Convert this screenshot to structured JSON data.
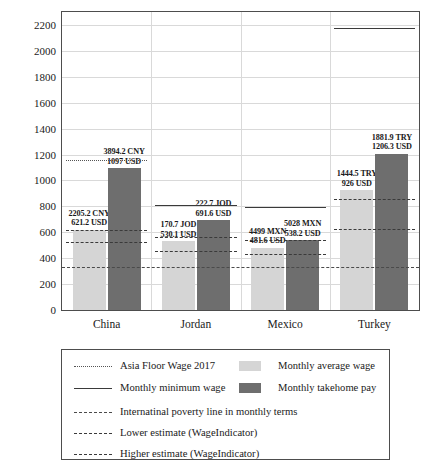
{
  "chart_data": {
    "type": "bar",
    "title": "",
    "xlabel": "",
    "ylabel": "PPP adjusted USD",
    "ylim": [
      0,
      2300
    ],
    "yticks": [
      0,
      200,
      400,
      600,
      800,
      1000,
      1200,
      1400,
      1600,
      1800,
      2000,
      2200
    ],
    "grid": true,
    "legend_position": "below-plot",
    "categories": [
      "China",
      "Jordan",
      "Mexico",
      "Turkey"
    ],
    "series": [
      {
        "name": "Monthly average wage",
        "color": "#d5d5d5",
        "values": [
          621.2,
          530.1,
          481.6,
          926
        ],
        "labels": [
          {
            "local": "2205.2 CNY",
            "usd": "621.2 USD"
          },
          {
            "local": "170.7 JOD",
            "usd": "530.1 USD"
          },
          {
            "local": "4499 MXN",
            "usd": "481.6 USD"
          },
          {
            "local": "1444.5 TRY",
            "usd": "926 USD"
          }
        ]
      },
      {
        "name": "Monthly takehome pay",
        "color": "#6e6e6e",
        "values": [
          1097,
          691.6,
          538.2,
          1206.3
        ],
        "labels": [
          {
            "local": "3894.2 CNY",
            "usd": "1097 USD"
          },
          {
            "local": "222.7 JOD",
            "usd": "691.6 USD"
          },
          {
            "local": "5028 MXN",
            "usd": "538.2 USD"
          },
          {
            "local": "1881.9 TRY",
            "usd": "1206.3 USD"
          }
        ]
      }
    ],
    "reference_lines": [
      {
        "name": "Asia Floor Wage 2017",
        "style": "dotted",
        "china": 1160,
        "jordan": null,
        "mexico": null,
        "turkey": null
      },
      {
        "name": "Monthly minimum wage",
        "style": "solid",
        "china": null,
        "jordan": 812,
        "mexico": 792,
        "turkey": 2180
      },
      {
        "name": "Internatinal poverty line in monthly terms",
        "style": "dash-dot",
        "value": 330
      },
      {
        "name": "Lower estimate (WageIndicator)",
        "style": "dashed",
        "china": 522,
        "jordan": 452,
        "mexico": 430,
        "turkey": 628
      },
      {
        "name": "Higher estimate (WageIndicator)",
        "style": "dashed",
        "china": 620,
        "jordan": 560,
        "mexico": 540,
        "turkey": 855
      }
    ]
  },
  "axis": {
    "y_title": "PPP adjusted USD",
    "y_ticks": [
      "2200",
      "2000",
      "1800",
      "1600",
      "1400",
      "1200",
      "1000",
      "800",
      "600",
      "400",
      "200",
      "0"
    ],
    "x_ticks": [
      "China",
      "Jordan",
      "Mexico",
      "Turkey"
    ]
  },
  "bar_labels": {
    "china_avg_local": "2205.2 CNY",
    "china_avg_usd": "621.2 USD",
    "china_take_local": "3894.2 CNY",
    "china_take_usd": "1097 USD",
    "jordan_avg_local": "170.7 JOD",
    "jordan_avg_usd": "530.1 USD",
    "jordan_take_local": "222.7 JOD",
    "jordan_take_usd": "691.6 USD",
    "mexico_avg_local": "4499 MXN",
    "mexico_avg_usd": "481.6 USD",
    "mexico_take_local": "5028 MXN",
    "mexico_take_usd": "538.2 USD",
    "turkey_avg_local": "1444.5 TRY",
    "turkey_avg_usd": "926 USD",
    "turkey_take_local": "1881.9 TRY",
    "turkey_take_usd": "1206.3 USD"
  },
  "legend": {
    "items": [
      {
        "label": "Asia Floor Wage 2017",
        "key": "dotted-line"
      },
      {
        "label": "Monthly average wage",
        "key": "light-swatch"
      },
      {
        "label": "Monthly minimum wage",
        "key": "solid-line"
      },
      {
        "label": "Monthly takehome pay",
        "key": "dark-swatch"
      },
      {
        "label": "Internatinal poverty line in monthly terms",
        "key": "dashdot-line"
      },
      {
        "label": "Lower estimate (WageIndicator)",
        "key": "dashed-line"
      },
      {
        "label": "Higher estimate (WageIndicator)",
        "key": "dashed-line"
      }
    ]
  },
  "colors": {
    "average_wage": "#d5d5d5",
    "takehome_pay": "#6e6e6e",
    "grid": "#d9d9d9",
    "frame": "#4d4d4d"
  }
}
